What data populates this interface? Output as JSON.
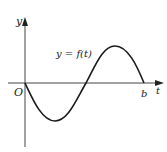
{
  "figure": {
    "type": "function-graph",
    "axes": {
      "x_label": "t",
      "y_label": "y",
      "origin_label": "O",
      "b_label": "b"
    },
    "curve_label": "y = f(t)",
    "curve_description": "one period of a negative sine-like wave from O to b",
    "colors": {
      "axis": "#333333",
      "curve": "#1a1a1a",
      "text": "#222222"
    }
  }
}
